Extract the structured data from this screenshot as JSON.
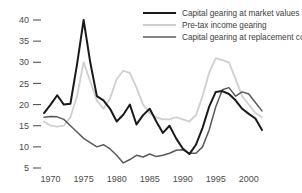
{
  "chart_data": {
    "type": "line",
    "title": "",
    "xlabel": "",
    "ylabel": "",
    "xlim": [
      1969,
      2002
    ],
    "ylim": [
      5,
      41
    ],
    "grid": false,
    "legend_position": "top-right",
    "y_ticks": [
      5,
      10,
      15,
      20,
      25,
      30,
      35,
      40
    ],
    "y_tick_labels": [
      "5",
      "10",
      "15",
      "20",
      "25",
      "30",
      "35",
      "40"
    ],
    "x_ticks": [
      1970,
      1975,
      1980,
      1985,
      1990,
      1995,
      2000
    ],
    "x_tick_labels": [
      "1970",
      "1975",
      "1980",
      "1985",
      "1990",
      "1995",
      "2000"
    ],
    "x": [
      1969,
      1970,
      1971,
      1972,
      1973,
      1974,
      1975,
      1976,
      1977,
      1978,
      1979,
      1980,
      1981,
      1982,
      1983,
      1984,
      1985,
      1986,
      1987,
      1988,
      1989,
      1990,
      1991,
      1992,
      1993,
      1994,
      1995,
      1996,
      1997,
      1998,
      1999,
      2000,
      2001,
      2002
    ],
    "series": [
      {
        "name": "Capital gearing at market values",
        "color": "#1a1a1a",
        "width": 2.0,
        "values": [
          18.0,
          20.0,
          22.2,
          20.0,
          20.2,
          29.5,
          40.0,
          30.0,
          22.0,
          21.0,
          19.0,
          16.0,
          17.6,
          20.0,
          15.3,
          17.5,
          19.0,
          16.0,
          13.3,
          15.0,
          12.0,
          9.6,
          8.3,
          10.5,
          14.5,
          19.5,
          23.0,
          23.2,
          22.5,
          21.0,
          19.0,
          17.8,
          16.7,
          14.0
        ]
      },
      {
        "name": "Pre-tax income gearing",
        "color": "#cfcfcf",
        "width": 1.8,
        "values": [
          16.0,
          15.0,
          14.8,
          15.0,
          17.0,
          22.0,
          30.0,
          25.5,
          21.0,
          19.0,
          21.5,
          26.0,
          28.0,
          27.5,
          24.0,
          20.0,
          18.0,
          17.0,
          16.5,
          16.5,
          17.0,
          16.5,
          16.0,
          17.5,
          22.0,
          27.5,
          31.0,
          30.5,
          30.0,
          26.0,
          22.0,
          20.0,
          18.0,
          17.0
        ]
      },
      {
        "name": "Capital gearing at replacement cost",
        "color": "#5a5a5a",
        "width": 1.5,
        "values": [
          17.0,
          17.2,
          17.1,
          16.5,
          15.0,
          13.5,
          12.0,
          11.0,
          10.0,
          10.5,
          9.5,
          8.0,
          6.2,
          7.0,
          8.0,
          7.6,
          8.3,
          7.7,
          8.0,
          8.5,
          9.2,
          9.3,
          8.5,
          8.5,
          10.0,
          14.0,
          19.5,
          23.5,
          24.0,
          22.0,
          23.0,
          22.5,
          20.5,
          18.5
        ]
      }
    ],
    "annotations": []
  },
  "legend": {
    "entries": [
      {
        "label": "Capital gearing at market values",
        "color": "#1a1a1a"
      },
      {
        "label": "Pre-tax income gearing",
        "color": "#cfcfcf"
      },
      {
        "label": "Capital gearing at replacement cost",
        "color": "#5a5a5a"
      }
    ]
  },
  "colors": {
    "background": "#ffffff",
    "axis": "#555555",
    "tick_text": "#4a4a4a"
  }
}
